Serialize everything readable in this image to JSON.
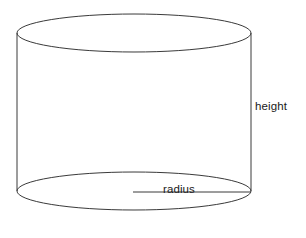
{
  "figure": {
    "name": "cylinder-diagram",
    "background_color": "#ffffff",
    "stroke_color": "#3a3a3a",
    "stroke_width": 1,
    "text_color": "#1a1a1a"
  },
  "labels": {
    "height": "height",
    "radius": "radius"
  },
  "geometry": {
    "top_ellipse": {
      "cx": 134,
      "cy": 33,
      "rx": 117,
      "ry": 19
    },
    "bottom_ellipse": {
      "cx": 134,
      "cy": 191,
      "rx": 117,
      "ry": 19
    },
    "left_edge": {
      "x": 17,
      "y1": 33,
      "y2": 191
    },
    "right_edge": {
      "x": 251,
      "y1": 33,
      "y2": 191
    },
    "radius_line": {
      "x1": 133,
      "x2": 251,
      "y": 192
    }
  }
}
